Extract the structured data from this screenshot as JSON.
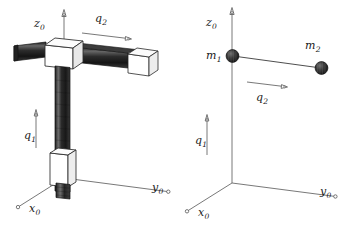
{
  "figure": {
    "caption": "",
    "background_color": "#ffffff",
    "ink_color": "#1a1a1a",
    "line_color": "#4d4d4d",
    "mass_color": "#2b2b2b",
    "rod_color": "#3a3a3a",
    "block_face_color": "#ffffff"
  },
  "left_panel": {
    "name": "cartesian-gantry-robot",
    "axis_labels": {
      "z": {
        "base": "z",
        "sub": "0"
      },
      "y": {
        "base": "y",
        "sub": "0"
      },
      "x": {
        "base": "x",
        "sub": "0"
      }
    },
    "joint_labels": {
      "q1": {
        "base": "q",
        "sub": "1"
      },
      "q2": {
        "base": "q",
        "sub": "2"
      }
    }
  },
  "right_panel": {
    "name": "point-mass-model",
    "axis_labels": {
      "z": {
        "base": "z",
        "sub": "0"
      },
      "y": {
        "base": "y",
        "sub": "0"
      },
      "x": {
        "base": "x",
        "sub": "0"
      }
    },
    "joint_labels": {
      "q1": {
        "base": "q",
        "sub": "1"
      },
      "q2": {
        "base": "q",
        "sub": "2"
      }
    },
    "mass_labels": {
      "m1": {
        "base": "m",
        "sub": "1"
      },
      "m2": {
        "base": "m",
        "sub": "2"
      }
    }
  }
}
